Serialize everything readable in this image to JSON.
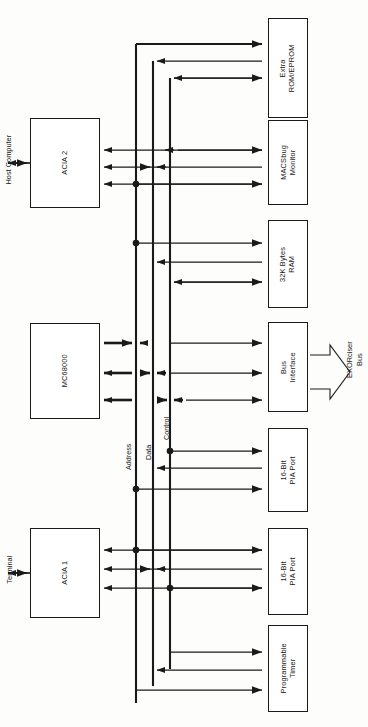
{
  "diagram": {
    "orientation": "rotated-90-ccw",
    "stroke_color": "#1a1a1a",
    "background_color": "#fdfdfc"
  },
  "blocks": {
    "cpu": {
      "label": "MC68000"
    },
    "acia1": {
      "label": "ACIA 1"
    },
    "acia2": {
      "label": "ACIA 2"
    },
    "extra_rom": {
      "label": "Extra\nROM/EPROM",
      "line1": "Extra",
      "line2": "ROM/EPROM"
    },
    "macsbug": {
      "label": "MACSbug\nMonitor",
      "line1": "MACSbug",
      "line2": "Monitor"
    },
    "ram": {
      "label": "32K Bytes\nRAM",
      "line1": "32K Bytes",
      "line2": "RAM"
    },
    "bus_interface": {
      "label": "Bus\nInterface",
      "line1": "Bus",
      "line2": "Interface"
    },
    "pia_top": {
      "label": "16-Bit\nPIA Port",
      "line1": "16-Bit",
      "line2": "PIA Port"
    },
    "pia_bottom": {
      "label": "16-Bit\nPIA Port",
      "line1": "16-Bit",
      "line2": "PIA Port"
    },
    "timer": {
      "label": "Programmable\nTimer",
      "line1": "Programmable",
      "line2": "Timer"
    }
  },
  "external_labels": {
    "host_computer": "Host Computer",
    "terminal": "Terminal",
    "exorciser_bus": "EXORciser\nBus",
    "exorciser_bus_line1": "EXORciser",
    "exorciser_bus_line2": "Bus"
  },
  "bus_labels": {
    "address": "Address",
    "data": "Data",
    "control": "Control"
  }
}
